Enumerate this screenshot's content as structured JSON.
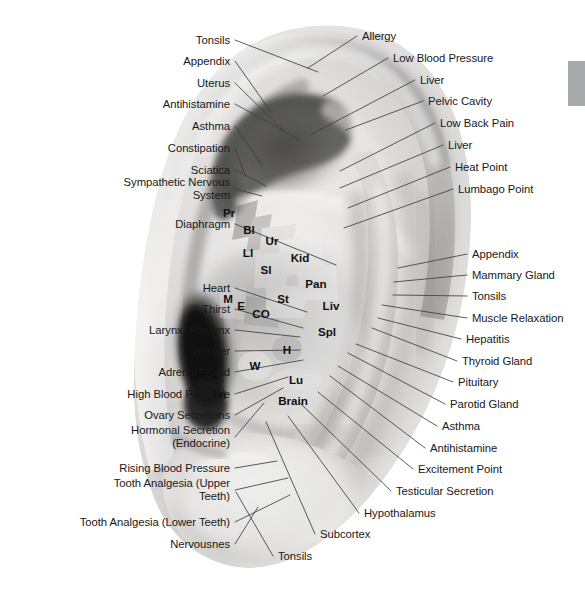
{
  "figure": {
    "kind": "auricular-acupuncture-chart",
    "photo_style": "grayscale photograph of a human right ear",
    "background_color": "#ffffff",
    "leader_line_color": "#3c3f44",
    "label_text_color": "#17181a"
  },
  "scrollbar": {
    "thumb_color": "#a8a9ab",
    "x": 568,
    "y": 61,
    "width": 17,
    "height": 45,
    "visible": true
  },
  "left_labels": [
    {
      "text": "Tonsils",
      "x": 230,
      "y": 40,
      "tip_x": 318,
      "tip_y": 72
    },
    {
      "text": "Appendix",
      "x": 230,
      "y": 61,
      "tip_x": 271,
      "tip_y": 112
    },
    {
      "text": "Uterus",
      "x": 230,
      "y": 83,
      "tip_x": 285,
      "tip_y": 132
    },
    {
      "text": "Antihistamine",
      "x": 230,
      "y": 104,
      "tip_x": 300,
      "tip_y": 140
    },
    {
      "text": "Asthma",
      "x": 230,
      "y": 126,
      "tip_x": 262,
      "tip_y": 165
    },
    {
      "text": "Constipation",
      "x": 230,
      "y": 148,
      "tip_x": 245,
      "tip_y": 175
    },
    {
      "text": "Sciatica",
      "x": 230,
      "y": 170,
      "tip_x": 266,
      "tip_y": 186
    },
    {
      "text": "Sympathetic Nervous\nSystem",
      "x": 230,
      "y": 189,
      "tip_x": 262,
      "tip_y": 196
    },
    {
      "text": "Diaphragm",
      "x": 230,
      "y": 224,
      "tip_x": 336,
      "tip_y": 265
    },
    {
      "text": "Heart",
      "x": 230,
      "y": 288,
      "tip_x": 307,
      "tip_y": 312
    },
    {
      "text": "Thirst",
      "x": 230,
      "y": 309,
      "tip_x": 303,
      "tip_y": 328
    },
    {
      "text": "Larynx, Pharynx",
      "x": 230,
      "y": 330,
      "tip_x": 300,
      "tip_y": 337
    },
    {
      "text": "Hunger",
      "x": 230,
      "y": 351,
      "tip_x": 300,
      "tip_y": 350
    },
    {
      "text": "Adrenal Gland",
      "x": 230,
      "y": 372,
      "tip_x": 303,
      "tip_y": 360
    },
    {
      "text": "High Blood Pressure",
      "x": 230,
      "y": 394,
      "tip_x": 288,
      "tip_y": 377
    },
    {
      "text": "Ovary Secretions",
      "x": 230,
      "y": 415,
      "tip_x": 283,
      "tip_y": 388
    },
    {
      "text": "Hormonal Secretion\n(Endocrine)",
      "x": 230,
      "y": 437,
      "tip_x": 264,
      "tip_y": 403
    },
    {
      "text": "Rising Blood Pressure",
      "x": 230,
      "y": 468,
      "tip_x": 277,
      "tip_y": 461
    },
    {
      "text": "Tooth Analgesia (Upper\nTeeth)",
      "x": 230,
      "y": 490,
      "tip_x": 288,
      "tip_y": 478
    },
    {
      "text": "Tooth Analgesia (Lower Teeth)",
      "x": 230,
      "y": 522,
      "tip_x": 290,
      "tip_y": 495
    },
    {
      "text": "Nervousnes",
      "x": 230,
      "y": 544,
      "tip_x": 258,
      "tip_y": 507
    }
  ],
  "right_labels": [
    {
      "text": "Allergy",
      "x": 362,
      "y": 36,
      "tip_x": 308,
      "tip_y": 68
    },
    {
      "text": "Low Blood Pressure",
      "x": 393,
      "y": 58,
      "tip_x": 323,
      "tip_y": 96
    },
    {
      "text": "Liver",
      "x": 420,
      "y": 80,
      "tip_x": 310,
      "tip_y": 135
    },
    {
      "text": "Pelvic Cavity",
      "x": 428,
      "y": 101,
      "tip_x": 346,
      "tip_y": 130
    },
    {
      "text": "Low Back Pain",
      "x": 440,
      "y": 123,
      "tip_x": 340,
      "tip_y": 171
    },
    {
      "text": "Liver",
      "x": 448,
      "y": 145,
      "tip_x": 340,
      "tip_y": 188
    },
    {
      "text": "Heat Point",
      "x": 455,
      "y": 167,
      "tip_x": 348,
      "tip_y": 208
    },
    {
      "text": "Lumbago Point",
      "x": 458,
      "y": 189,
      "tip_x": 344,
      "tip_y": 228
    },
    {
      "text": "Appendix",
      "x": 472,
      "y": 254,
      "tip_x": 398,
      "tip_y": 268
    },
    {
      "text": "Mammary Gland",
      "x": 472,
      "y": 275,
      "tip_x": 394,
      "tip_y": 282
    },
    {
      "text": "Tonsils",
      "x": 472,
      "y": 296,
      "tip_x": 393,
      "tip_y": 295
    },
    {
      "text": "Muscle Relaxation",
      "x": 472,
      "y": 318,
      "tip_x": 382,
      "tip_y": 305
    },
    {
      "text": "Hepatitis",
      "x": 466,
      "y": 339,
      "tip_x": 378,
      "tip_y": 318
    },
    {
      "text": "Thyroid Gland",
      "x": 462,
      "y": 361,
      "tip_x": 372,
      "tip_y": 328
    },
    {
      "text": "Pituitary",
      "x": 458,
      "y": 382,
      "tip_x": 356,
      "tip_y": 344
    },
    {
      "text": "Parotid Gland",
      "x": 450,
      "y": 404,
      "tip_x": 348,
      "tip_y": 353
    },
    {
      "text": "Asthma",
      "x": 442,
      "y": 426,
      "tip_x": 338,
      "tip_y": 366
    },
    {
      "text": "Antihistamine",
      "x": 430,
      "y": 448,
      "tip_x": 330,
      "tip_y": 376
    },
    {
      "text": "Excitement Point",
      "x": 418,
      "y": 469,
      "tip_x": 318,
      "tip_y": 392
    },
    {
      "text": "Testicular Secretion",
      "x": 396,
      "y": 491,
      "tip_x": 300,
      "tip_y": 403
    },
    {
      "text": "Hypothalamus",
      "x": 364,
      "y": 513,
      "tip_x": 288,
      "tip_y": 416
    },
    {
      "text": "Subcortex",
      "x": 320,
      "y": 534,
      "tip_x": 266,
      "tip_y": 422
    },
    {
      "text": "Tonsils",
      "x": 278,
      "y": 556,
      "tip_x": 236,
      "tip_y": 492
    }
  ],
  "point_abbreviations": [
    {
      "code": "Pr",
      "x": 229,
      "y": 212,
      "meaning": "Prostate"
    },
    {
      "code": "Bl",
      "x": 249,
      "y": 229,
      "meaning": "Bladder"
    },
    {
      "code": "Ur",
      "x": 272,
      "y": 240,
      "meaning": "Ureter"
    },
    {
      "code": "LI",
      "x": 248,
      "y": 252,
      "meaning": "Large Intestine"
    },
    {
      "code": "Kid",
      "x": 300,
      "y": 257,
      "meaning": "Kidney"
    },
    {
      "code": "SI",
      "x": 266,
      "y": 269,
      "meaning": "Small Intestine"
    },
    {
      "code": "Pan",
      "x": 316,
      "y": 283,
      "meaning": "Pancreas"
    },
    {
      "code": "M",
      "x": 228,
      "y": 298,
      "meaning": "Mouth"
    },
    {
      "code": "E",
      "x": 241,
      "y": 305,
      "meaning": "Esophagus"
    },
    {
      "code": "CO",
      "x": 261,
      "y": 313,
      "meaning": "Cardiac Orifice"
    },
    {
      "code": "St",
      "x": 283,
      "y": 298,
      "meaning": "Stomach"
    },
    {
      "code": "Liv",
      "x": 331,
      "y": 305,
      "meaning": "Liver"
    },
    {
      "code": "Spl",
      "x": 327,
      "y": 331,
      "meaning": "Spleen"
    },
    {
      "code": "H",
      "x": 287,
      "y": 349,
      "meaning": "Heart"
    },
    {
      "code": "W",
      "x": 255,
      "y": 365,
      "meaning": "Windpipe"
    },
    {
      "code": "Lu",
      "x": 296,
      "y": 379,
      "meaning": "Lung"
    },
    {
      "code": "Tri",
      "x": 219,
      "y": 394,
      "meaning": "Triple Energizer"
    },
    {
      "code": "Brain",
      "x": 293,
      "y": 400,
      "meaning": "Brain"
    }
  ]
}
